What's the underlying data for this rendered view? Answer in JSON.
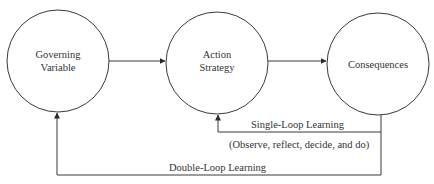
{
  "diagram": {
    "type": "flow",
    "colors": {
      "stroke": "#3a3a3a",
      "text": "#333333",
      "background": "#ffffff"
    },
    "nodes": [
      {
        "id": "governing",
        "line1": "Governing",
        "line2": "Variable"
      },
      {
        "id": "action",
        "line1": "Action",
        "line2": "Strategy"
      },
      {
        "id": "consequences",
        "line1": "Consequences"
      }
    ],
    "edges": [
      {
        "from": "governing",
        "to": "action"
      },
      {
        "from": "action",
        "to": "consequences"
      },
      {
        "from": "consequences",
        "to": "action",
        "label": "Single-Loop Learning",
        "sublabel": "(Observe, reflect, decide, and do)"
      },
      {
        "from": "consequences",
        "to": "governing",
        "label": "Double-Loop Learning"
      }
    ]
  }
}
